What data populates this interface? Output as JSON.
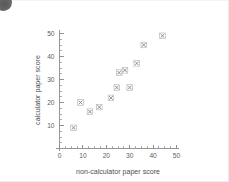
{
  "page": {
    "corner_mark": "dark-disc-mark",
    "background_color": "#ffffff",
    "ink_color": "#5d5d60"
  },
  "chart_data": {
    "type": "scatter",
    "title": "",
    "subtitle": "",
    "xlabel": "non-calculator paper score",
    "ylabel": "calculator paper score",
    "xlim": [
      0,
      50
    ],
    "ylim": [
      0,
      50
    ],
    "x_ticks": [
      0,
      10,
      20,
      30,
      40,
      50
    ],
    "y_ticks": [
      10,
      20,
      30,
      40,
      50
    ],
    "x_tick_labels": [
      "0",
      "10",
      "20",
      "30",
      "40",
      "50"
    ],
    "y_tick_labels": [
      "10",
      "20",
      "30",
      "40",
      "50"
    ],
    "x_minor_tick_step": 2.5,
    "y_minor_tick_step": 2.5,
    "grid": false,
    "legend": false,
    "legend_position": "none",
    "marker_style": "cross-in-square",
    "marker_color": "#7c7c80",
    "points": [
      {
        "x": 6,
        "y": 9
      },
      {
        "x": 9,
        "y": 20
      },
      {
        "x": 13,
        "y": 16
      },
      {
        "x": 17,
        "y": 18
      },
      {
        "x": 22,
        "y": 22
      },
      {
        "x": 24.5,
        "y": 26.5
      },
      {
        "x": 25.5,
        "y": 33
      },
      {
        "x": 28,
        "y": 34
      },
      {
        "x": 30,
        "y": 26.5
      },
      {
        "x": 33,
        "y": 37
      },
      {
        "x": 36,
        "y": 45
      },
      {
        "x": 44,
        "y": 49
      }
    ],
    "n_points": 12
  }
}
